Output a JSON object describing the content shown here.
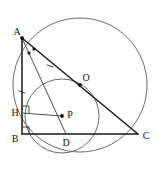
{
  "figure": {
    "canvas": {
      "width": 158,
      "height": 173,
      "background": "#ffffff"
    },
    "colors": {
      "triangle_stroke": "#1a1a1a",
      "circle_stroke": "#5b5b5b",
      "thin_segment_stroke": "#3a3a3a",
      "label_color": "#111111",
      "background": "#ffffff"
    },
    "points": [
      {
        "id": "A",
        "label": "A",
        "x": 22,
        "y": 38,
        "label_x": 17,
        "label_y": 33,
        "dot": true
      },
      {
        "id": "O",
        "label": "O",
        "x": 80,
        "y": 85,
        "label_x": 86,
        "label_y": 79,
        "dot": true
      },
      {
        "id": "C",
        "label": "C",
        "x": 138,
        "y": 134,
        "label_x": 146,
        "label_y": 137,
        "dot": false
      },
      {
        "id": "B",
        "label": "B",
        "x": 22,
        "y": 134,
        "label_x": 15,
        "label_y": 140,
        "dot": false
      },
      {
        "id": "H",
        "label": "H",
        "x": 22,
        "y": 113,
        "label_x": 15,
        "label_y": 114,
        "dot": false
      },
      {
        "id": "P",
        "label": "P",
        "x": 62,
        "y": 116,
        "label_x": 70,
        "label_y": 116,
        "dot": true
      },
      {
        "id": "D",
        "label": "D",
        "x": 66,
        "y": 134,
        "label_x": 66,
        "label_y": 144,
        "dot": false
      }
    ],
    "circles": [
      {
        "id": "circumcircle",
        "name": "circumcircle-ABC",
        "cx": 80,
        "cy": 85,
        "r": 67
      },
      {
        "id": "incircle",
        "name": "incircle-P",
        "cx": 62,
        "cy": 116,
        "r": 37
      }
    ],
    "segments": [
      {
        "id": "AB",
        "name": "segment-ab",
        "from": "A",
        "to": "B",
        "style": "thick"
      },
      {
        "id": "BC",
        "name": "segment-bc",
        "from": "B",
        "to": "C",
        "style": "thick"
      },
      {
        "id": "AC",
        "name": "segment-ac",
        "from": "A",
        "to": "C",
        "style": "thick"
      },
      {
        "id": "AD",
        "name": "segment-ad",
        "from": "A",
        "to": "D",
        "style": "thin"
      },
      {
        "id": "HP",
        "name": "segment-hp",
        "from": "H",
        "to": "P",
        "style": "thin"
      }
    ],
    "right_angles": [
      {
        "id": "angle-H",
        "name": "right-angle-at-h",
        "x": 22,
        "y": 113,
        "size": 7,
        "dir_x": 1,
        "dir_y": -1
      },
      {
        "id": "angle-B",
        "name": "right-angle-at-b",
        "x": 22,
        "y": 134,
        "size": 7,
        "dir_x": 1,
        "dir_y": -1
      }
    ],
    "angle_marks": [
      {
        "id": "bisector-mark-1",
        "name": "angle-bisector-dot-1",
        "x": 29,
        "y": 53
      },
      {
        "id": "bisector-mark-2",
        "name": "angle-bisector-dot-2",
        "x": 34,
        "y": 49
      }
    ],
    "tick_marks": [
      {
        "id": "tick-ab",
        "name": "congruence-tick-ab",
        "x": 22,
        "y": 92,
        "angle": 20
      },
      {
        "id": "tick-ao",
        "name": "congruence-tick-ao",
        "x": 50,
        "y": 66,
        "angle": 20
      }
    ],
    "labels": {
      "A": "A",
      "B": "B",
      "C": "C",
      "D": "D",
      "H": "H",
      "O": "O",
      "P": "P"
    }
  }
}
